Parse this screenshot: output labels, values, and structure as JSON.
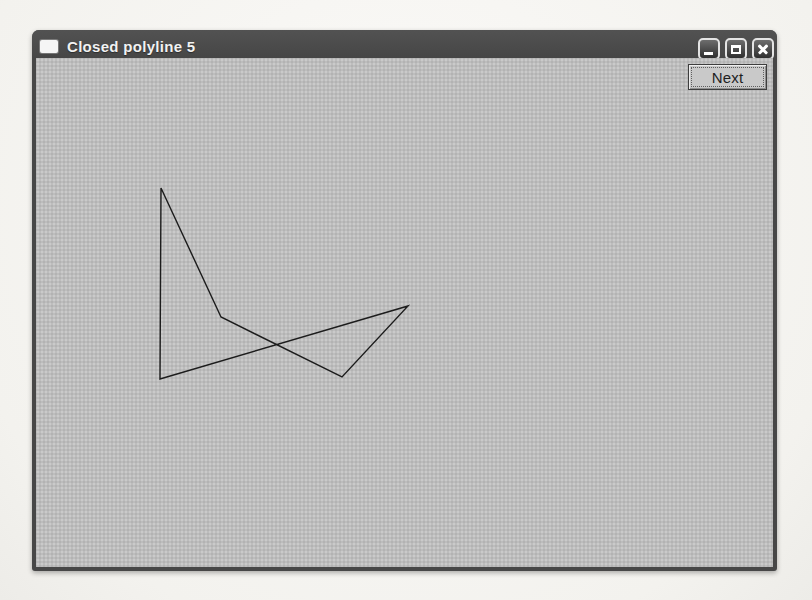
{
  "window": {
    "title": "Closed polyline 5",
    "controls": {
      "minimize": "minimize",
      "maximize": "maximize",
      "close": "close"
    }
  },
  "toolbar": {
    "next_label": "Next"
  },
  "canvas": {
    "polyline": {
      "type": "closed",
      "vertex_count": 5,
      "vertices": [
        [
          125,
          130
        ],
        [
          185,
          259
        ],
        [
          306,
          319
        ],
        [
          372,
          248
        ],
        [
          124,
          321
        ]
      ],
      "stroke": "#1c1c1c",
      "stroke_width": 1.4
    }
  },
  "colors": {
    "titlebar": "#474747",
    "canvas_background": "#bdbdbd",
    "page_background": "#f5f4f0",
    "button_face": "#c9c9c9",
    "line": "#1c1c1c"
  }
}
